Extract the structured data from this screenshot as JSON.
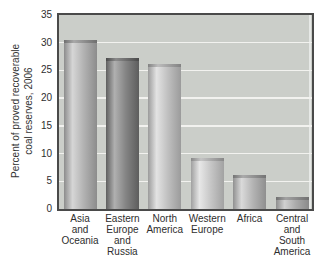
{
  "chart_data": {
    "type": "bar",
    "title": "",
    "xlabel": "",
    "ylabel": "Percent of proved recoverable coal reserves, 2006",
    "ylabel_lines": [
      "Percent of proved recoverable",
      "coal reserves, 2006"
    ],
    "ylim": [
      0,
      35
    ],
    "yticks": [
      0,
      5,
      10,
      15,
      20,
      25,
      30,
      35
    ],
    "grid": "horizontal",
    "legend_position": "none",
    "bar_style": "3d-cylinder",
    "categories": [
      "Asia and Oceania",
      "Eastern Europe and Russia",
      "North America",
      "Western Europe",
      "Africa",
      "Central and South America"
    ],
    "category_label_lines": [
      [
        "Asia",
        "and",
        "Oceania"
      ],
      [
        "Eastern",
        "Europe",
        "and",
        "Russia"
      ],
      [
        "North",
        "America"
      ],
      [
        "Western",
        "Europe"
      ],
      [
        "Africa"
      ],
      [
        "Central",
        "and",
        "South",
        "America"
      ]
    ],
    "values": [
      30.4,
      27.3,
      26.2,
      9.2,
      6.2,
      2.2
    ],
    "bar_colors": [
      {
        "body": [
          "#8c8c8c",
          "#d6d6d6",
          "#b2b2b2",
          "#8c8c8c"
        ],
        "cap": [
          "#6f6f6f",
          "#a8a8a8",
          "#6f6f6f"
        ]
      },
      {
        "body": [
          "#5f5f5f",
          "#b0b0b0",
          "#848484",
          "#5d5d5d"
        ],
        "cap": [
          "#4a4a4a",
          "#8a8a8a",
          "#4a4a4a"
        ]
      },
      {
        "body": [
          "#9b9b9b",
          "#e3e3e3",
          "#c0c0c0",
          "#9b9b9b"
        ],
        "cap": [
          "#828282",
          "#bdbdbd",
          "#828282"
        ]
      },
      {
        "body": [
          "#a0a0a0",
          "#e7e7e7",
          "#c6c6c6",
          "#a2a2a2"
        ],
        "cap": [
          "#888888",
          "#c4c4c4",
          "#888888"
        ]
      },
      {
        "body": [
          "#909090",
          "#dadada",
          "#b4b4b4",
          "#8f8f8f"
        ],
        "cap": [
          "#747474",
          "#ababab",
          "#747474"
        ]
      },
      {
        "body": [
          "#8e8e8e",
          "#d0d0d0",
          "#ababab",
          "#8a8a8a"
        ],
        "cap": [
          "#707070",
          "#a2a2a2",
          "#707070"
        ]
      }
    ]
  },
  "colors": {
    "page_bg": "#ffffff",
    "plot_bg": "#cbcec9",
    "grid_line": "#f2f2ef",
    "frame": "#4a4a4a",
    "text": "#2e2e2e"
  }
}
